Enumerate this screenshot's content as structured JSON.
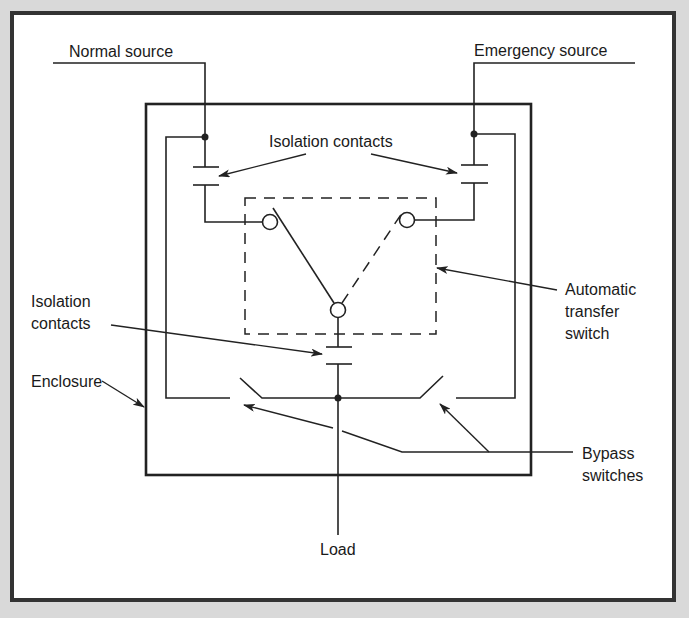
{
  "diagram": {
    "colors": {
      "background": "#d9d9d9",
      "panel": "#ffffff",
      "frame": "#333333",
      "line": "#222222"
    },
    "labels": {
      "normal_source": "Normal source",
      "emergency_source": "Emergency source",
      "isolation_contacts_top": "Isolation contacts",
      "isolation_contacts_left_line1": "Isolation",
      "isolation_contacts_left_line2": "contacts",
      "enclosure": "Enclosure",
      "ats_line1": "Automatic",
      "ats_line2": "transfer",
      "ats_line3": "switch",
      "bypass_line1": "Bypass",
      "bypass_line2": "switches",
      "load": "Load"
    },
    "components": [
      {
        "id": "normal-source-feed",
        "type": "wire"
      },
      {
        "id": "emergency-source-feed",
        "type": "wire"
      },
      {
        "id": "enclosure",
        "type": "box"
      },
      {
        "id": "normal-isolation-contact",
        "type": "contact"
      },
      {
        "id": "emergency-isolation-contact",
        "type": "contact"
      },
      {
        "id": "load-isolation-contact",
        "type": "contact"
      },
      {
        "id": "automatic-transfer-switch",
        "type": "dashed-box"
      },
      {
        "id": "left-bypass-switch",
        "type": "switch"
      },
      {
        "id": "right-bypass-switch",
        "type": "switch"
      },
      {
        "id": "load-feed",
        "type": "wire"
      }
    ]
  }
}
